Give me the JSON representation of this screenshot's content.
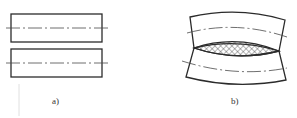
{
  "figure": {
    "panels": [
      {
        "id": "a",
        "label": "a)",
        "description": "two separate straight parallel plates with centerlines"
      },
      {
        "id": "b",
        "label": "b)",
        "description": "two plates joined by cross-hatched weld bead, distorted (curved) after welding"
      }
    ],
    "colors": {
      "line": "#2b2b2b",
      "centerline": "#4a4a4a",
      "hatch": "#333333",
      "background": "#ffffff"
    }
  }
}
